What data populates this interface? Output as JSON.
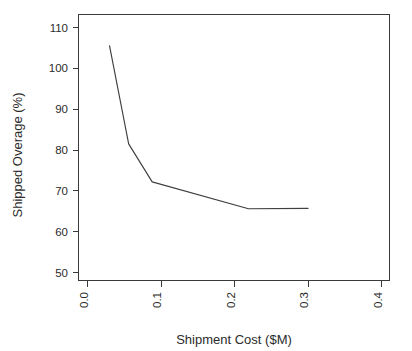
{
  "chart_data": {
    "type": "line",
    "title": "",
    "xlabel": "Shipment Cost ($M)",
    "ylabel": "Shipped Overage (%)",
    "xlim": [
      0.0,
      0.4
    ],
    "ylim": [
      50,
      112
    ],
    "grid": false,
    "legend": null,
    "xticks": [
      0.0,
      0.1,
      0.2,
      0.3,
      0.4
    ],
    "xticklabels": [
      "0.0",
      "0.1",
      "0.2",
      "0.3",
      "0.4"
    ],
    "yticks": [
      50,
      60,
      70,
      80,
      90,
      100,
      110
    ],
    "yticklabels": [
      "50",
      "60",
      "70",
      "80",
      "90",
      "100",
      "110"
    ],
    "series": [
      {
        "name": "Shipped Overage vs Shipment Cost",
        "color": "#3f3f3f",
        "x": [
          0.03,
          0.056,
          0.088,
          0.219,
          0.3
        ],
        "y": [
          105.5,
          81.5,
          72.2,
          65.6,
          65.7
        ]
      }
    ]
  },
  "axes": {
    "x_axis_label": "Shipment Cost ($M)",
    "y_axis_label": "Shipped Overage (%)"
  }
}
